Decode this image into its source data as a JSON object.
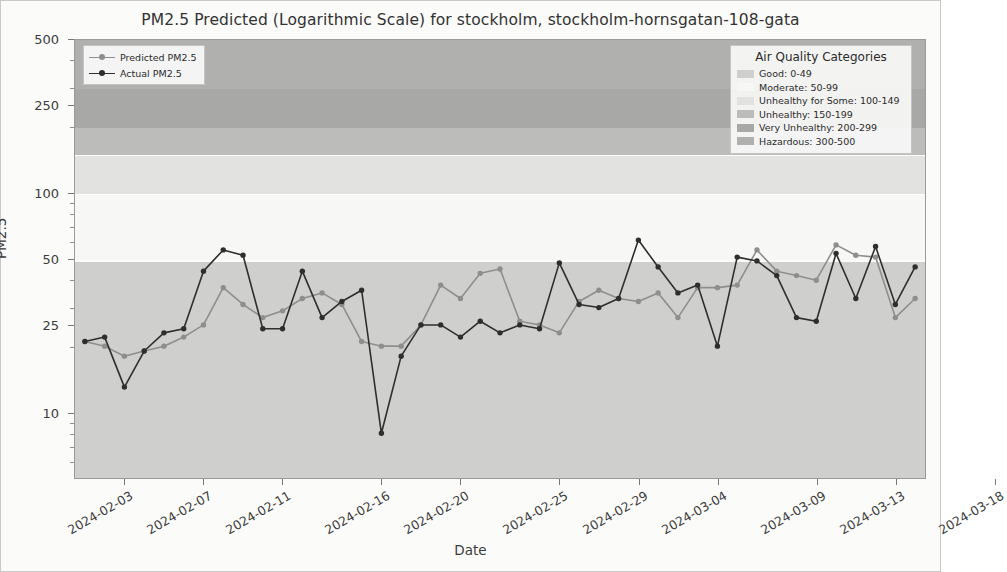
{
  "chart_data": {
    "type": "line",
    "title": "PM2.5 Predicted (Logarithmic Scale) for stockholm, stockholm-hornsgatan-108-gata",
    "xlabel": "Date",
    "ylabel": "PM2.5",
    "yscale": "log",
    "ylim": [
      5,
      500
    ],
    "ytick_labels": [
      "500",
      "250",
      "100",
      "50",
      "25",
      "10"
    ],
    "ytick_values": [
      500,
      250,
      100,
      50,
      25,
      10
    ],
    "xtick_labels": [
      "2024-02-03",
      "2024-02-07",
      "2024-02-11",
      "2024-02-16",
      "2024-02-20",
      "2024-02-25",
      "2024-02-29",
      "2024-03-04",
      "2024-03-09",
      "2024-03-13",
      "2024-03-18"
    ],
    "grid": false,
    "legend_position": "upper left",
    "x": [
      "2024-02-01",
      "2024-02-02",
      "2024-02-03",
      "2024-02-04",
      "2024-02-05",
      "2024-02-06",
      "2024-02-07",
      "2024-02-08",
      "2024-02-09",
      "2024-02-10",
      "2024-02-11",
      "2024-02-12",
      "2024-02-13",
      "2024-02-14",
      "2024-02-15",
      "2024-02-16",
      "2024-02-17",
      "2024-02-18",
      "2024-02-19",
      "2024-02-20",
      "2024-02-21",
      "2024-02-22",
      "2024-02-23",
      "2024-02-24",
      "2024-02-25",
      "2024-02-26",
      "2024-02-27",
      "2024-02-28",
      "2024-02-29",
      "2024-03-01",
      "2024-03-02",
      "2024-03-03",
      "2024-03-04",
      "2024-03-05",
      "2024-03-06",
      "2024-03-07",
      "2024-03-08",
      "2024-03-09",
      "2024-03-10",
      "2024-03-11",
      "2024-03-12",
      "2024-03-13",
      "2024-03-14"
    ],
    "series": [
      {
        "name": "Predicted PM2.5",
        "color": "#8e8e8c",
        "values": [
          21,
          20,
          18,
          19,
          20,
          22,
          25,
          37,
          31,
          27,
          29,
          33,
          35,
          31,
          21,
          20,
          20,
          25,
          38,
          33,
          43,
          45,
          26,
          25,
          23,
          32,
          36,
          33,
          32,
          35,
          27,
          37,
          37,
          38,
          55,
          44,
          42,
          40,
          58,
          52,
          51,
          27,
          33
        ]
      },
      {
        "name": "Actual PM2.5",
        "color": "#2e2e2e",
        "values": [
          21,
          22,
          13,
          19,
          23,
          24,
          44,
          55,
          52,
          24,
          24,
          44,
          27,
          32,
          36,
          8,
          18,
          25,
          25,
          22,
          26,
          23,
          25,
          24,
          48,
          31,
          30,
          33,
          61,
          46,
          35,
          38,
          20,
          51,
          49,
          42,
          27,
          26,
          53,
          33,
          57,
          31,
          46
        ]
      }
    ],
    "bands": [
      {
        "name": "Good",
        "range": "0-49",
        "label": "Good: 0-49",
        "lo": 0,
        "hi": 49,
        "color": "#cfcfcd"
      },
      {
        "name": "Moderate",
        "range": "50-99",
        "label": "Moderate: 50-99",
        "lo": 50,
        "hi": 99,
        "color": "#f7f7f6"
      },
      {
        "name": "Unhealthy for Some",
        "range": "100-149",
        "label": "Unhealthy for Some: 100-149",
        "lo": 100,
        "hi": 149,
        "color": "#e2e2e0"
      },
      {
        "name": "Unhealthy",
        "range": "150-199",
        "label": "Unhealthy: 150-199",
        "lo": 150,
        "hi": 199,
        "color": "#bcbcba"
      },
      {
        "name": "Very Unhealthy",
        "range": "200-299",
        "label": "Very Unhealthy: 200-299",
        "lo": 200,
        "hi": 299,
        "color": "#a8a8a6"
      },
      {
        "name": "Hazardous",
        "range": "300-500",
        "label": "Hazardous: 300-500",
        "lo": 300,
        "hi": 500,
        "color": "#b0b0ae"
      }
    ]
  },
  "series_legend": {
    "items": [
      {
        "label": "Predicted PM2.5"
      },
      {
        "label": "Actual PM2.5"
      }
    ]
  },
  "category_legend": {
    "title": "Air Quality Categories"
  }
}
